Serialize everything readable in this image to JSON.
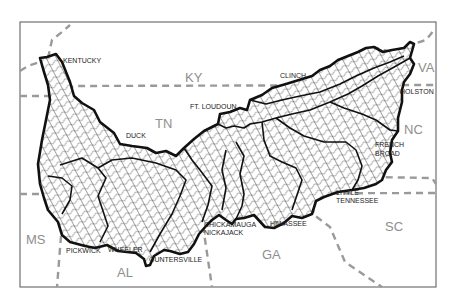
{
  "map": {
    "title": "",
    "state_labels": [
      {
        "id": "ky",
        "text": "KY",
        "x": 185,
        "y": 82
      },
      {
        "id": "tn",
        "text": "TN",
        "x": 155,
        "y": 128
      },
      {
        "id": "va",
        "text": "VA",
        "x": 418,
        "y": 72
      },
      {
        "id": "nc",
        "text": "NC",
        "x": 404,
        "y": 134
      },
      {
        "id": "ms",
        "text": "MS",
        "x": 26,
        "y": 244
      },
      {
        "id": "al",
        "text": "AL",
        "x": 117,
        "y": 277
      },
      {
        "id": "ga",
        "text": "GA",
        "x": 262,
        "y": 259
      },
      {
        "id": "sc",
        "text": "SC",
        "x": 385,
        "y": 231
      }
    ],
    "reservoir_labels": [
      {
        "id": "kentucky",
        "text": "KENTUCKY",
        "x": 63,
        "y": 63
      },
      {
        "id": "clinch",
        "text": "CLINCH",
        "x": 280,
        "y": 78
      },
      {
        "id": "ft-loudoun",
        "text": "FT. LOUDOUN",
        "x": 190,
        "y": 109
      },
      {
        "id": "holston",
        "text": "HOLSTON",
        "x": 400,
        "y": 94
      },
      {
        "id": "duck",
        "text": "DUCK",
        "x": 126,
        "y": 138
      },
      {
        "id": "french-broad-1",
        "text": "FRENCH",
        "x": 375,
        "y": 147
      },
      {
        "id": "french-broad-2",
        "text": "BROAD",
        "x": 375,
        "y": 156
      },
      {
        "id": "little-tennessee-1",
        "text": "LITTLE",
        "x": 336,
        "y": 195
      },
      {
        "id": "little-tennessee-2",
        "text": "TENNESSEE",
        "x": 336,
        "y": 203
      },
      {
        "id": "chickamauga",
        "text": "CHICKAMAUGA",
        "x": 204,
        "y": 227
      },
      {
        "id": "nickajack",
        "text": "NICKAJACK",
        "x": 204,
        "y": 235
      },
      {
        "id": "hiwassee",
        "text": "HIWASSEE",
        "x": 270,
        "y": 226
      },
      {
        "id": "pickwick",
        "text": "PICKWICK",
        "x": 66,
        "y": 253
      },
      {
        "id": "wheeler",
        "text": "WHEELER",
        "x": 108,
        "y": 252
      },
      {
        "id": "guntersville",
        "text": "GUNTERSVILLE",
        "x": 149,
        "y": 262
      }
    ],
    "colors": {
      "basin_outline": "#111111",
      "state_boundary": "#9a9a9a",
      "state_label": "#8e8e8e",
      "frame": "#555555"
    }
  }
}
